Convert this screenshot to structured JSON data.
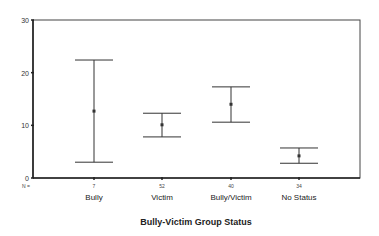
{
  "chart_data": {
    "type": "errorbar",
    "title": "",
    "xlabel": "Bully-Victim Group Status",
    "ylabel": "",
    "ylim": [
      0,
      30
    ],
    "yticks": [
      0,
      10,
      20,
      30
    ],
    "n_label": "N =",
    "categories": [
      "Bully",
      "Victim",
      "Bully/Victim",
      "No Status"
    ],
    "n": [
      7,
      52,
      40,
      34
    ],
    "mean": [
      12.7,
      10.1,
      14.0,
      4.2
    ],
    "upper": [
      22.4,
      12.3,
      17.3,
      5.7
    ],
    "lower": [
      3.0,
      7.8,
      10.6,
      2.8
    ],
    "grid": false
  }
}
